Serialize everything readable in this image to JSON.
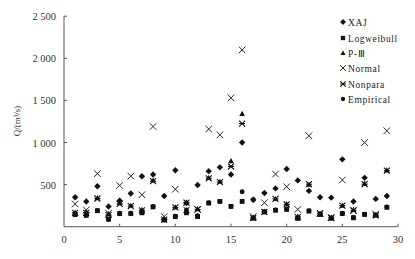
{
  "chart_data": {
    "type": "scatter",
    "title": "",
    "xlabel": "",
    "ylabel": "Q/(m³/s)",
    "xlim": [
      0,
      30
    ],
    "ylim": [
      0,
      2500
    ],
    "x_ticks": [
      "0",
      "5",
      "10",
      "15",
      "20",
      "25",
      "30"
    ],
    "y_ticks": [
      "0",
      "500",
      "1 000",
      "1 500",
      "2 000",
      "2 500"
    ],
    "grid": false,
    "legend_position": "upper right",
    "x": [
      1,
      2,
      3,
      4,
      5,
      6,
      7,
      8,
      9,
      10,
      11,
      12,
      13,
      14,
      15,
      16,
      17,
      18,
      19,
      20,
      21,
      22,
      23,
      24,
      25,
      26,
      27,
      28,
      29
    ],
    "series": [
      {
        "name": "XAJ",
        "marker": "diamond",
        "values": [
          350,
          300,
          480,
          240,
          310,
          395,
          600,
          620,
          365,
          670,
          280,
          495,
          660,
          705,
          620,
          1000,
          320,
          400,
          455,
          685,
          550,
          425,
          350,
          345,
          800,
          300,
          580,
          330,
          365
        ]
      },
      {
        "name": "Logweibull",
        "marker": "square",
        "values": [
          145,
          135,
          190,
          90,
          155,
          155,
          165,
          235,
          80,
          120,
          165,
          120,
          280,
          300,
          240,
          300,
          100,
          175,
          195,
          205,
          100,
          185,
          145,
          100,
          155,
          105,
          145,
          135,
          230
        ]
      },
      {
        "name": "P-Ⅲ",
        "marker": "triangle",
        "values": [
          170,
          170,
          340,
          150,
          280,
          250,
          200,
          550,
          90,
          230,
          290,
          210,
          580,
          535,
          780,
          1340,
          110,
          180,
          330,
          270,
          120,
          500,
          160,
          110,
          250,
          200,
          510,
          140,
          670
        ]
      },
      {
        "name": "Normal",
        "marker": "x",
        "values": [
          270,
          200,
          630,
          160,
          490,
          600,
          380,
          1190,
          120,
          445,
          200,
          205,
          1160,
          1090,
          1530,
          2100,
          120,
          285,
          625,
          475,
          205,
          1080,
          160,
          110,
          555,
          190,
          1000,
          150,
          1140
        ]
      },
      {
        "name": "Nonpara",
        "marker": "asterisk",
        "values": [
          165,
          165,
          335,
          140,
          270,
          245,
          195,
          540,
          85,
          230,
          285,
          205,
          575,
          530,
          715,
          1225,
          105,
          175,
          330,
          265,
          115,
          505,
          155,
          105,
          250,
          195,
          505,
          135,
          665
        ]
      },
      {
        "name": "Empirical",
        "marker": "dot",
        "values": [
          145,
          135,
          190,
          85,
          160,
          160,
          170,
          240,
          80,
          125,
          200,
          130,
          285,
          300,
          245,
          415,
          320,
          180,
          200,
          210,
          100,
          190,
          150,
          105,
          160,
          110,
          150,
          140,
          235
        ]
      }
    ]
  },
  "legend": {
    "items": [
      {
        "label": "XAJ",
        "marker": "diamond"
      },
      {
        "label": "Logweibull",
        "marker": "square"
      },
      {
        "label": "P-Ⅲ",
        "marker": "triangle"
      },
      {
        "label": "Normal",
        "marker": "x"
      },
      {
        "label": "Nonpara",
        "marker": "asterisk"
      },
      {
        "label": "Empirical",
        "marker": "dot"
      }
    ]
  },
  "colors": {
    "axis": "#555555",
    "marker": "#111111"
  }
}
